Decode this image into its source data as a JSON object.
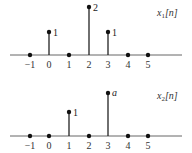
{
  "plots": [
    {
      "label": "x1[n]",
      "label_main": "x",
      "label_sub": "1",
      "label_arg": "[n]",
      "n_ticks": [
        "−1",
        "0",
        "1",
        "2",
        "3",
        "4",
        "5"
      ],
      "samples": [
        {
          "n": -1,
          "value": 0,
          "label": ""
        },
        {
          "n": 0,
          "value": 1,
          "label": "1"
        },
        {
          "n": 1,
          "value": 0,
          "label": ""
        },
        {
          "n": 2,
          "value": 2,
          "label": "2"
        },
        {
          "n": 3,
          "value": 1,
          "label": "1"
        },
        {
          "n": 4,
          "value": 0,
          "label": ""
        },
        {
          "n": 5,
          "value": 0,
          "label": ""
        }
      ]
    },
    {
      "label": "x2[n]",
      "label_main": "x",
      "label_sub": "2",
      "label_arg": "[n]",
      "n_ticks": [
        "−1",
        "0",
        "1",
        "2",
        "3",
        "4",
        "5"
      ],
      "samples": [
        {
          "n": -1,
          "value": 0,
          "label": ""
        },
        {
          "n": 0,
          "value": 0,
          "label": ""
        },
        {
          "n": 1,
          "value": 1,
          "label": "1"
        },
        {
          "n": 2,
          "value": 0,
          "label": ""
        },
        {
          "n": 3,
          "value": "a",
          "label": "a"
        },
        {
          "n": 4,
          "value": 0,
          "label": ""
        },
        {
          "n": 5,
          "value": 0,
          "label": ""
        }
      ]
    }
  ],
  "colors": {
    "stem": "#222222",
    "axis": "#555555"
  }
}
